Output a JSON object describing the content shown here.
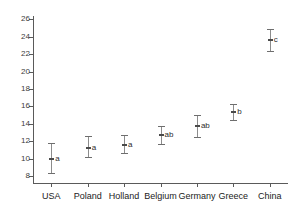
{
  "chart_data": {
    "type": "scatter",
    "title": "",
    "subtitle": "",
    "xlabel": "",
    "ylabel": "",
    "grid": false,
    "legend": "none",
    "categories": [
      "USA",
      "Poland",
      "Holland",
      "Belgium",
      "Germany",
      "Greece",
      "China"
    ],
    "values": [
      10.0,
      11.2,
      11.6,
      12.7,
      13.8,
      15.4,
      23.6
    ],
    "error_low": [
      8.3,
      10.2,
      10.6,
      11.7,
      12.5,
      14.5,
      22.4
    ],
    "error_high": [
      11.8,
      12.6,
      12.7,
      13.8,
      15.0,
      16.3,
      24.9
    ],
    "group_labels": [
      "a",
      "a",
      "a",
      "ab",
      "ab",
      "b",
      "c"
    ],
    "ylim": [
      7.2,
      26.4
    ],
    "ytick_labels": [
      "8",
      "10",
      "12",
      "14",
      "16",
      "18",
      "20",
      "22",
      "24",
      "26"
    ],
    "ytick_values": [
      8,
      10,
      12,
      14,
      16,
      18,
      20,
      22,
      24,
      26
    ],
    "xtick_labels": [
      "USA",
      "Poland",
      "Holland",
      "Belgium",
      "Germany",
      "Greece",
      "China"
    ],
    "colors": {
      "axis": "#5a5a5a",
      "errorbar": "#8c8c8c",
      "marker": "#4a4a4a",
      "text": "#222222",
      "background": "#ffffff"
    }
  }
}
